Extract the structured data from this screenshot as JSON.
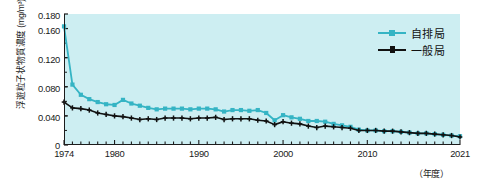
{
  "chart_data": {
    "type": "line",
    "title": "",
    "xlabel": "(年度)",
    "ylabel": "浮遊粒子状物質濃度 (mg/m³)",
    "ylim": [
      0,
      0.18
    ],
    "xlim": [
      1974,
      2021
    ],
    "grid": false,
    "legend_position": "top-right",
    "yticks": [
      "0.180",
      "0.160",
      "0.120",
      "0.080",
      "0.040",
      "0"
    ],
    "ytick_values": [
      0.18,
      0.16,
      0.12,
      0.08,
      0.04,
      0
    ],
    "xticks": [
      "1974",
      "1980",
      "1990",
      "2000",
      "2010",
      "2021"
    ],
    "xtick_values": [
      1974,
      1980,
      1990,
      2000,
      2010,
      2021
    ],
    "x": [
      1974,
      1975,
      1976,
      1977,
      1978,
      1979,
      1980,
      1981,
      1982,
      1983,
      1984,
      1985,
      1986,
      1987,
      1988,
      1989,
      1990,
      1991,
      1992,
      1993,
      1994,
      1995,
      1996,
      1997,
      1998,
      1999,
      2000,
      2001,
      2002,
      2003,
      2004,
      2005,
      2006,
      2007,
      2008,
      2009,
      2010,
      2011,
      2012,
      2013,
      2014,
      2015,
      2016,
      2017,
      2018,
      2019,
      2020,
      2021
    ],
    "series": [
      {
        "name": "自排局",
        "color": "#35b4c4",
        "marker": "square",
        "values": [
          0.163,
          0.083,
          0.069,
          0.063,
          0.059,
          0.056,
          0.055,
          0.062,
          0.057,
          0.054,
          0.051,
          0.049,
          0.05,
          0.05,
          0.05,
          0.049,
          0.05,
          0.05,
          0.049,
          0.046,
          0.048,
          0.048,
          0.047,
          0.048,
          0.044,
          0.034,
          0.041,
          0.038,
          0.036,
          0.033,
          0.033,
          0.032,
          0.029,
          0.027,
          0.025,
          0.021,
          0.02,
          0.02,
          0.019,
          0.019,
          0.018,
          0.017,
          0.016,
          0.016,
          0.015,
          0.014,
          0.013,
          0.012
        ]
      },
      {
        "name": "一般局",
        "color": "#111111",
        "marker": "plus",
        "values": [
          0.059,
          0.051,
          0.05,
          0.048,
          0.044,
          0.042,
          0.04,
          0.039,
          0.037,
          0.035,
          0.036,
          0.035,
          0.037,
          0.037,
          0.037,
          0.036,
          0.037,
          0.037,
          0.038,
          0.035,
          0.036,
          0.036,
          0.036,
          0.034,
          0.033,
          0.028,
          0.032,
          0.03,
          0.029,
          0.026,
          0.024,
          0.026,
          0.025,
          0.024,
          0.023,
          0.02,
          0.02,
          0.02,
          0.019,
          0.019,
          0.018,
          0.017,
          0.016,
          0.016,
          0.015,
          0.014,
          0.013,
          0.011
        ]
      }
    ]
  },
  "axes": {
    "y_label": "浮遊粒子状物質濃度 (mg/m³)",
    "x_unit_label": "（年度）"
  },
  "legend": {
    "items": [
      {
        "label": "自排局",
        "color": "#35b4c4"
      },
      {
        "label": "一般局",
        "color": "#111111"
      }
    ]
  },
  "colors": {
    "panel_background": "#cdeef2",
    "axis": "#1c1c1c",
    "series_cyan": "#35b4c4",
    "series_black": "#111111"
  }
}
